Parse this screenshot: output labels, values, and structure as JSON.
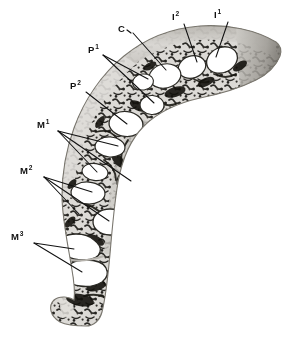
{
  "figure": {
    "background_color": "#ffffff",
    "ink_color": "#111111",
    "bone_matrix_color": "#d8d6d2",
    "trabecula_color": "#14130f",
    "alveolus_fill": "#ffffff",
    "cortical_shade": "#8d8a85"
  },
  "labels": [
    {
      "id": "I1",
      "text": "I",
      "superscript": "1",
      "name": "first-incisor",
      "x": 214,
      "y": 10
    },
    {
      "id": "I2",
      "text": "I",
      "superscript": "2",
      "name": "second-incisor",
      "x": 172,
      "y": 12
    },
    {
      "id": "C",
      "text": "C",
      "superscript": "",
      "name": "canine",
      "x": 119,
      "y": 26
    },
    {
      "id": "P1",
      "text": "P",
      "superscript": "1",
      "name": "first-premolar",
      "x": 87,
      "y": 47
    },
    {
      "id": "P2",
      "text": "P",
      "superscript": "2",
      "name": "second-premolar",
      "x": 69,
      "y": 83
    },
    {
      "id": "M1",
      "text": "M",
      "superscript": "1",
      "name": "first-molar",
      "x": 36,
      "y": 122
    },
    {
      "id": "M2",
      "text": "M",
      "superscript": "2",
      "name": "second-molar",
      "x": 19,
      "y": 168
    },
    {
      "id": "M3",
      "text": "M",
      "superscript": "3",
      "name": "third-molar",
      "x": 11,
      "y": 234
    }
  ],
  "leaders": [
    {
      "for": "I1",
      "points": "228,22 214,56"
    },
    {
      "for": "I2",
      "points": "184,24 197,61"
    },
    {
      "for": "C",
      "points": "134,33 165,69"
    },
    {
      "for": "P1a",
      "points": "103,55 149,79"
    },
    {
      "for": "P1b",
      "points": "103,55 155,104"
    },
    {
      "for": "P2",
      "points": "86,92 127,125"
    },
    {
      "for": "M1a",
      "points": "58,131 118,146"
    },
    {
      "for": "M1b",
      "points": "58,131 130,182"
    },
    {
      "for": "M1c",
      "points": "58,131 96,173"
    },
    {
      "for": "M2a",
      "points": "44,177 92,192"
    },
    {
      "for": "M2b",
      "points": "44,177 108,222"
    },
    {
      "for": "M2c",
      "points": "44,177 78,215"
    },
    {
      "for": "M3a",
      "points": "34,243 73,249"
    },
    {
      "for": "M3b",
      "points": "34,243 80,272"
    }
  ],
  "alveoli": [
    {
      "name": "alveolus-I1",
      "cx": 222,
      "cy": 60,
      "rx": 16,
      "ry": 12,
      "rot": -26
    },
    {
      "name": "alveolus-I2",
      "cx": 192,
      "cy": 66,
      "rx": 14,
      "ry": 11,
      "rot": -20
    },
    {
      "name": "alveolus-C",
      "cx": 165,
      "cy": 76,
      "rx": 16,
      "ry": 12,
      "rot": -12
    },
    {
      "name": "alveolus-P1-upper",
      "cx": 143,
      "cy": 82,
      "rx": 10,
      "ry": 8,
      "rot": -6
    },
    {
      "name": "alveolus-P1-lower",
      "cx": 152,
      "cy": 105,
      "rx": 12,
      "ry": 9,
      "rot": 4
    },
    {
      "name": "alveolus-P2",
      "cx": 126,
      "cy": 124,
      "rx": 17,
      "ry": 12,
      "rot": 4
    },
    {
      "name": "alveolus-M1-upper",
      "cx": 110,
      "cy": 147,
      "rx": 15,
      "ry": 10,
      "rot": 4
    },
    {
      "name": "alveolus-M1-mid",
      "cx": 95,
      "cy": 172,
      "rx": 13,
      "ry": 9,
      "rot": 6
    },
    {
      "name": "alveolus-M1-lower",
      "cx": 133,
      "cy": 182,
      "rx": 16,
      "ry": 12,
      "rot": 2
    },
    {
      "name": "alveolus-M2-upper",
      "cx": 88,
      "cy": 193,
      "rx": 17,
      "ry": 11,
      "rot": 4
    },
    {
      "name": "alveolus-M2-lower",
      "cx": 110,
      "cy": 222,
      "rx": 17,
      "ry": 13,
      "rot": 2
    },
    {
      "name": "alveolus-M3-upper",
      "cx": 76,
      "cy": 248,
      "rx": 20,
      "ry": 12,
      "rot": 2
    },
    {
      "name": "alveolus-M3-lower",
      "cx": 84,
      "cy": 272,
      "rx": 19,
      "ry": 13,
      "rot": 0
    }
  ]
}
